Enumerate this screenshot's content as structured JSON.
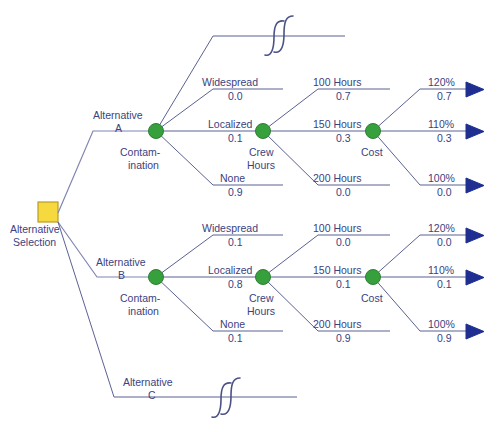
{
  "diagram": {
    "type": "decision-tree",
    "colors": {
      "decision_node": "#f5d93f",
      "chance_node": "#36a03c",
      "terminal_node": "#1f2f91",
      "line": "#5b6192",
      "text": "#3b4280",
      "background": "#ffffff"
    },
    "root": {
      "label_line1": "Alternative",
      "label_line2": "Selection",
      "shape": "square"
    },
    "alternatives": [
      {
        "id": "A",
        "label_line1": "Alternative",
        "label_line2": "A",
        "truncated": false
      },
      {
        "id": "B",
        "label_line1": "Alternative",
        "label_line2": "B",
        "truncated": false
      },
      {
        "id": "C",
        "label_line1": "Alternative",
        "label_line2": "C",
        "truncated": true
      }
    ],
    "node_labels": {
      "contamination_line1": "Contam-",
      "contamination_line2": "ination",
      "crew_hours_line1": "Crew",
      "crew_hours_line2": "Hours",
      "cost": "Cost"
    },
    "branches": {
      "contamination": [
        {
          "label": "Widespread",
          "prob_a": "0.0",
          "prob_b": "0.1"
        },
        {
          "label": "Localized",
          "prob_a": "0.1",
          "prob_b": "0.8"
        },
        {
          "label": "None",
          "prob_a": "0.9",
          "prob_b": "0.1"
        }
      ],
      "crew_hours": [
        {
          "label": "100 Hours",
          "prob_a": "0.7",
          "prob_b": "0.0"
        },
        {
          "label": "150 Hours",
          "prob_a": "0.3",
          "prob_b": "0.1"
        },
        {
          "label": "200 Hours",
          "prob_a": "0.0",
          "prob_b": "0.9"
        }
      ],
      "cost": [
        {
          "label": "120%",
          "prob_a": "0.7",
          "prob_b": "0.0"
        },
        {
          "label": "110%",
          "prob_a": "0.3",
          "prob_b": "0.1"
        },
        {
          "label": "100%",
          "prob_a": "0.0",
          "prob_b": "0.9"
        }
      ]
    },
    "break_symbol": "s-curve-break"
  }
}
